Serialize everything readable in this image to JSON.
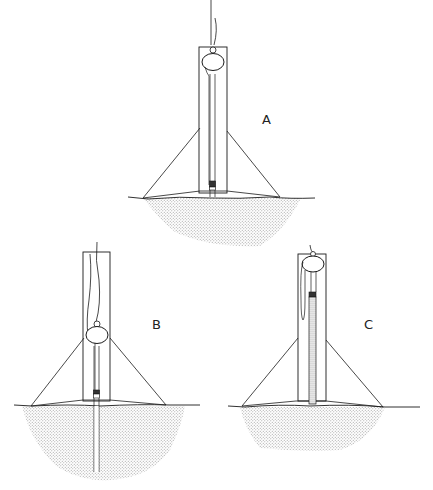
{
  "figure": {
    "type": "technical line drawing",
    "panels": [
      {
        "id": "A",
        "label": "A",
        "variant": "float at top, inner tube ends at ground surface, shallow soil body"
      },
      {
        "id": "B",
        "label": "B",
        "variant": "float lower in frame, tube extends deep into soil"
      },
      {
        "id": "C",
        "label": "C",
        "variant": "short frame, float at top, stippled (filled) tube inside frame"
      }
    ],
    "colors": {
      "line": "#1a1a1a",
      "stipple": "#bdbdbd",
      "background": "#ffffff"
    }
  }
}
